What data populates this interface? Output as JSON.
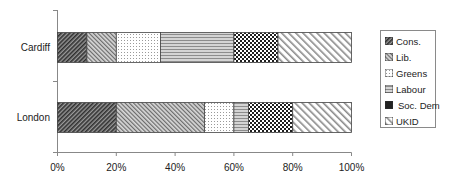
{
  "chart_data": {
    "type": "bar",
    "orientation": "horizontal",
    "stacked": "percent",
    "title": "",
    "xlabel": "",
    "ylabel": "",
    "xlim": [
      0,
      100
    ],
    "x_ticks": [
      "0%",
      "20%",
      "40%",
      "60%",
      "80%",
      "100%"
    ],
    "categories": [
      "Cardiff",
      "London"
    ],
    "series": [
      {
        "name": "Cons.",
        "values": [
          10,
          20
        ],
        "pattern": "dense-diagonal-dark"
      },
      {
        "name": "Lib.",
        "values": [
          10,
          30
        ],
        "pattern": "diagonal-medium"
      },
      {
        "name": "Greens",
        "values": [
          15,
          10
        ],
        "pattern": "dots-light"
      },
      {
        "name": "Labour",
        "values": [
          25,
          5
        ],
        "pattern": "wave-gray"
      },
      {
        "name": "Soc. Dem",
        "values": [
          15,
          15
        ],
        "pattern": "checker-dark"
      },
      {
        "name": "UKID",
        "values": [
          25,
          20
        ],
        "pattern": "wide-diagonal-light"
      }
    ],
    "legend_position": "right",
    "grid": false
  },
  "legend": {
    "items": [
      "Cons.",
      "Lib.",
      "Greens",
      "Labour",
      "Soc. Dem",
      "UKID"
    ]
  }
}
